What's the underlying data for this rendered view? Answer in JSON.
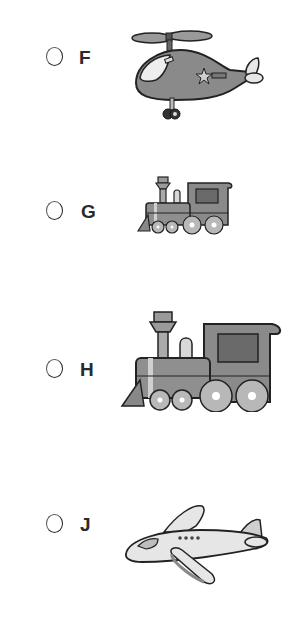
{
  "question": {
    "options": [
      {
        "letter": "F",
        "picture": "helicopter"
      },
      {
        "letter": "G",
        "picture": "small-train"
      },
      {
        "letter": "H",
        "picture": "large-train"
      },
      {
        "letter": "J",
        "picture": "airplane"
      }
    ]
  },
  "colors": {
    "body_fill": "#8a8a8a",
    "light_fill": "#e6e6e6",
    "outline": "#222222",
    "text": "#2a2a2a"
  }
}
